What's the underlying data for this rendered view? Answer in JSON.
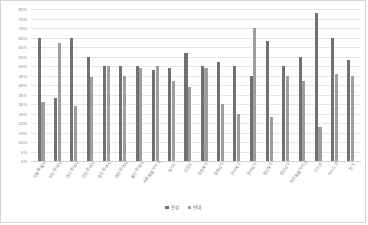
{
  "chart_data": {
    "type": "bar",
    "title": "",
    "xlabel": "",
    "ylabel": "",
    "ylim": [
      0,
      80
    ],
    "grid": true,
    "legend_position": "bottom",
    "ytick_labels": [
      "80%",
      "75%",
      "70%",
      "65%",
      "60%",
      "55%",
      "50%",
      "45%",
      "40%",
      "35%",
      "30%",
      "25%",
      "20%",
      "15%",
      "10%",
      "5%",
      "0%"
    ],
    "ytick_values": [
      80,
      75,
      70,
      65,
      60,
      55,
      50,
      45,
      40,
      35,
      30,
      25,
      20,
      15,
      10,
      5,
      0
    ],
    "categories": [
      "서울특별시",
      "부산광역시",
      "대구광역시",
      "인천광역시",
      "광주광역시",
      "대전광역시",
      "울산광역시",
      "세종특별자치시",
      "경기도",
      "강원도",
      "충청북도",
      "충청남도",
      "전라북도",
      "전라남도",
      "경상북도",
      "경상남도",
      "제주특별자치도",
      "수도권",
      "비수도권",
      "전국"
    ],
    "series": [
      {
        "name": "찬성",
        "color": "#717171",
        "values": [
          65,
          33,
          65,
          55,
          50,
          50,
          50,
          48,
          49,
          57,
          50,
          52,
          50,
          45,
          63,
          50,
          55,
          78,
          65,
          53
        ]
      },
      {
        "name": "반대",
        "color": "#9e9e9e",
        "values": [
          31,
          62,
          29,
          44,
          50,
          45,
          49,
          50,
          42,
          39,
          49,
          30,
          25,
          70,
          23,
          45,
          42,
          18,
          46,
          45
        ]
      }
    ]
  },
  "legend": {
    "items": [
      {
        "label": "찬성"
      },
      {
        "label": "반대"
      }
    ]
  },
  "colors": {
    "series_agree": "#717171",
    "series_oppose": "#9e9e9e",
    "gridline": "#e6e6e6",
    "axis": "#cfcfcf",
    "tick_text": "#8a8a8a",
    "border": "#d4d4d4"
  }
}
